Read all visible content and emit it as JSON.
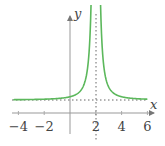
{
  "chart_data": {
    "type": "line",
    "title": "",
    "xlabel": "x",
    "ylabel": "y",
    "xlim": [
      -4.4,
      6.2
    ],
    "ylim": [
      -1,
      8.5
    ],
    "x_ticks": [
      -4,
      -2,
      2,
      4,
      6
    ],
    "x_tick_labels": [
      "−4",
      "−2",
      "2",
      "4",
      "6"
    ],
    "function": "y = 1/(x-2)^2 + 1",
    "asymptotes": {
      "vertical": 2,
      "horizontal": 1
    },
    "series": [
      {
        "name": "f(x)",
        "color": "#5cb85c",
        "x": [
          -4.4,
          -3,
          -2,
          -1,
          0,
          0.5,
          1,
          1.3,
          1.5,
          1.6,
          1.63,
          2.37,
          2.4,
          2.5,
          2.7,
          3,
          3.5,
          4,
          5,
          6,
          6.2
        ],
        "y": [
          1.024,
          1.04,
          1.063,
          1.111,
          1.25,
          1.444,
          2.0,
          3.04,
          5.0,
          7.25,
          8.3,
          8.3,
          7.25,
          5.0,
          3.04,
          2.0,
          1.444,
          1.25,
          1.111,
          1.063,
          1.057
        ]
      }
    ],
    "grid": false,
    "legend": null
  },
  "colors": {
    "curve": "#5cb85c",
    "axis": "#888888",
    "asymptote": "#666666"
  }
}
